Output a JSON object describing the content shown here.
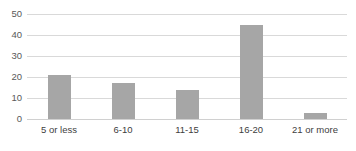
{
  "chart_data": {
    "type": "bar",
    "title": "",
    "subtitle": "",
    "xlabel": "",
    "ylabel": "",
    "categories": [
      "5 or less",
      "6-10",
      "11-15",
      "16-20",
      "21 or more"
    ],
    "values": [
      21,
      17,
      14,
      45,
      3
    ],
    "series": [
      {
        "name": "",
        "values": [
          21,
          17,
          14,
          45,
          3
        ]
      }
    ],
    "ylim": [
      0,
      50
    ],
    "yticks": [
      0,
      10,
      20,
      30,
      40,
      50
    ],
    "ytick_labels": [
      "0",
      "10",
      "20",
      "30",
      "40",
      "50"
    ],
    "grid": true,
    "grid_axis": "y",
    "legend": false,
    "legend_position": "none",
    "bar_color": "#a6a6a6",
    "gridline_color": "#d9d9d9",
    "background_color": "#ffffff",
    "tick_label_color": "#595959",
    "category_label_color": "#404040"
  }
}
